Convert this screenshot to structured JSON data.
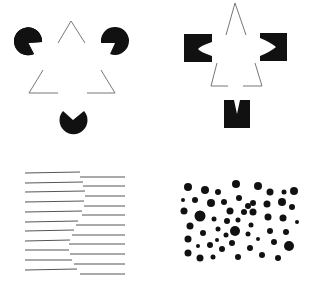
{
  "figure": {
    "background": "#ffffff",
    "ink": "#111111",
    "line_color": "#777777",
    "panels": [
      {
        "id": "kanizsa-triangle",
        "label": "Kanizsa triangle with pac-man inducers"
      },
      {
        "id": "notched-squares-triangle",
        "label": "Illusory triangle with notched square inducers"
      },
      {
        "id": "offset-gratings",
        "label": "Illusory contour from offset line gratings"
      },
      {
        "id": "dot-circle",
        "label": "Illusory circle in a dot field"
      }
    ]
  }
}
